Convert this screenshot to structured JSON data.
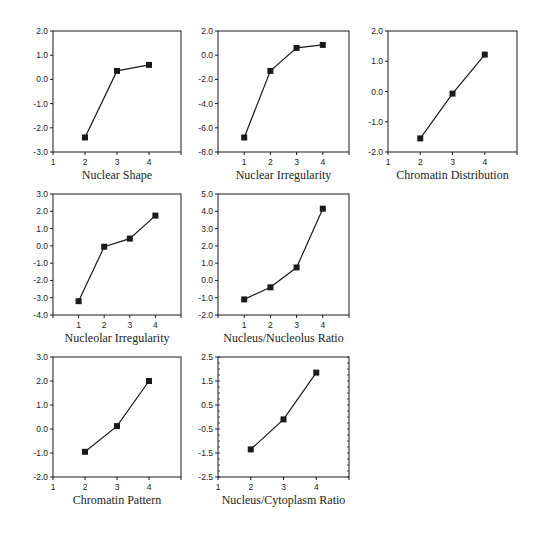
{
  "figure": {
    "colors": {
      "ink": "#1a1a1a",
      "background": "#ffffff"
    }
  },
  "chart_data": [
    {
      "type": "line",
      "xlabel": "Nuclear Shape",
      "ylabel": "",
      "x_ticks": [
        1,
        2,
        3,
        4
      ],
      "y_ticks": [
        "2.0",
        "1.0",
        "0.0",
        "-1.0",
        "-2.0",
        "-3.0"
      ],
      "xlim": [
        1,
        5
      ],
      "ylim": [
        -3.0,
        2.0
      ],
      "minor_y_ticks": false,
      "grid": false,
      "x": [
        2,
        3,
        4
      ],
      "values": [
        -2.4,
        0.35,
        0.6
      ],
      "marker": "square"
    },
    {
      "type": "line",
      "xlabel": "Nuclear Irregularity",
      "ylabel": "",
      "x_ticks": [
        1,
        2,
        3,
        4
      ],
      "y_ticks": [
        "2.0",
        "0.0",
        "-2.0",
        "-4.0",
        "-6.0",
        "-8.0"
      ],
      "xlim": [
        0,
        5
      ],
      "ylim": [
        -8.0,
        2.0
      ],
      "minor_y_ticks": false,
      "grid": false,
      "x": [
        1,
        2,
        3,
        4
      ],
      "values": [
        -6.8,
        -1.3,
        0.6,
        0.85
      ],
      "marker": "square"
    },
    {
      "type": "line",
      "xlabel": "Chromatin Distribution",
      "ylabel": "",
      "x_ticks": [
        1,
        2,
        3,
        4
      ],
      "y_ticks": [
        "2.0",
        "1.0",
        "0.0",
        "-1.0",
        "-2.0"
      ],
      "xlim": [
        1,
        5
      ],
      "ylim": [
        -2.0,
        2.0
      ],
      "minor_y_ticks": false,
      "grid": false,
      "x": [
        2,
        3,
        4
      ],
      "values": [
        -1.55,
        -0.07,
        1.22
      ],
      "marker": "square"
    },
    {
      "type": "line",
      "xlabel": "Nucleolar Irregularity",
      "ylabel": "",
      "x_ticks": [
        1,
        2,
        3,
        4
      ],
      "y_ticks": [
        "3.0",
        "2.0",
        "1.0",
        "0.0",
        "-1.0",
        "-2.0",
        "-3.0",
        "-4.0"
      ],
      "xlim": [
        0,
        5
      ],
      "ylim": [
        -4.0,
        3.0
      ],
      "minor_y_ticks": false,
      "grid": false,
      "x": [
        1,
        2,
        3,
        4
      ],
      "values": [
        -3.2,
        -0.05,
        0.42,
        1.75
      ],
      "marker": "square"
    },
    {
      "type": "line",
      "xlabel": "Nucleus/Nucleolus Ratio",
      "ylabel": "",
      "x_ticks": [
        1,
        2,
        3,
        4
      ],
      "y_ticks": [
        "5.0",
        "4.0",
        "3.0",
        "2.0",
        "1.0",
        "0.0",
        "-1.0",
        "-2.0"
      ],
      "xlim": [
        0,
        5
      ],
      "ylim": [
        -2.0,
        5.0
      ],
      "minor_y_ticks": false,
      "grid": false,
      "x": [
        1,
        2,
        3,
        4
      ],
      "values": [
        -1.1,
        -0.4,
        0.75,
        4.15
      ],
      "marker": "square"
    },
    {
      "type": "line",
      "xlabel": "Chromatin Pattern",
      "ylabel": "",
      "x_ticks": [
        1,
        2,
        3,
        4
      ],
      "y_ticks": [
        "3.0",
        "2.0",
        "1.0",
        "0.0",
        "-1.0",
        "-2.0"
      ],
      "xlim": [
        1,
        5
      ],
      "ylim": [
        -2.0,
        3.0
      ],
      "minor_y_ticks": false,
      "grid": false,
      "x": [
        2,
        3,
        4
      ],
      "values": [
        -0.95,
        0.12,
        2.0
      ],
      "marker": "square"
    },
    {
      "type": "line",
      "xlabel": "Nucleus/Cytoplasm Ratio",
      "ylabel": "",
      "x_ticks": [
        1,
        2,
        3,
        4
      ],
      "y_ticks": [
        "2.5",
        "1.5",
        "0.5",
        "-0.5",
        "-1.5",
        "-2.5"
      ],
      "xlim": [
        1,
        5
      ],
      "ylim": [
        -2.5,
        2.5
      ],
      "minor_y_ticks": true,
      "grid": false,
      "x": [
        2,
        3,
        4
      ],
      "values": [
        -1.35,
        -0.1,
        1.85
      ],
      "marker": "square"
    }
  ],
  "layout": {
    "panels": [
      {
        "left": 53,
        "top": 31,
        "width": 128,
        "height": 121
      },
      {
        "left": 218,
        "top": 31,
        "width": 131,
        "height": 121
      },
      {
        "left": 388,
        "top": 31,
        "width": 129,
        "height": 121
      },
      {
        "left": 53,
        "top": 194,
        "width": 128,
        "height": 121
      },
      {
        "left": 218,
        "top": 194,
        "width": 131,
        "height": 121
      },
      {
        "left": 53,
        "top": 357,
        "width": 128,
        "height": 120
      },
      {
        "left": 218,
        "top": 357,
        "width": 131,
        "height": 120
      }
    ]
  }
}
